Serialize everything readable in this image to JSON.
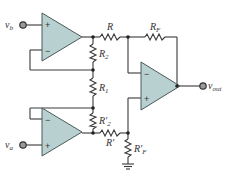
{
  "diagram": {
    "type": "circuit-schematic",
    "inputs": {
      "vb": {
        "label": "v",
        "sub": "b"
      },
      "va": {
        "label": "v",
        "sub": "a"
      }
    },
    "output": {
      "label": "v",
      "sub": "out"
    },
    "opamps": [
      {
        "id": "op1",
        "plus": "+",
        "minus": "−"
      },
      {
        "id": "op2",
        "plus": "+",
        "minus": "−"
      },
      {
        "id": "op3",
        "plus": "+",
        "minus": "−"
      }
    ],
    "resistors": {
      "R": {
        "label": "R",
        "sub": ""
      },
      "RF": {
        "label": "R",
        "sub": "F"
      },
      "R2": {
        "label": "R",
        "sub": "2"
      },
      "R1": {
        "label": "R",
        "sub": "1"
      },
      "R2p": {
        "label": "R′",
        "sub": "2"
      },
      "Rp": {
        "label": "R′",
        "sub": ""
      },
      "RFp": {
        "label": "R′",
        "sub": "F"
      }
    },
    "colors": {
      "opamp_fill": "#b9d0d0",
      "wire": "#3a3a3a",
      "terminal": "#9a9a9a"
    }
  }
}
